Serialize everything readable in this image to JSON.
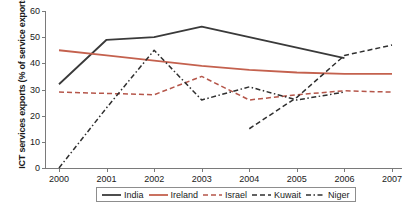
{
  "chart_data": {
    "type": "line",
    "title": "",
    "xlabel": "",
    "ylabel": "ICT services exports (% of service exports)",
    "x": [
      2000,
      2001,
      2002,
      2003,
      2004,
      2005,
      2006,
      2007
    ],
    "xtick_labels": [
      "2000",
      "2001",
      "2002",
      "2003",
      "2004",
      "2005",
      "2006",
      "2007"
    ],
    "ytick_labels": [
      "0",
      "10",
      "20",
      "30",
      "40",
      "50",
      "60"
    ],
    "ylim": [
      0,
      60
    ],
    "ytick_step": 10,
    "grid": false,
    "legend_position": "bottom-center",
    "series": [
      {
        "name": "India",
        "color": "#3a3a3a",
        "style": "solid",
        "x": [
          2000,
          2001,
          2002,
          2003,
          2004,
          2005,
          2006
        ],
        "values": [
          32,
          49,
          50,
          54,
          50,
          46,
          42
        ]
      },
      {
        "name": "Ireland",
        "color": "#c4614e",
        "style": "solid",
        "x": [
          2000,
          2001,
          2002,
          2003,
          2004,
          2005,
          2006,
          2007
        ],
        "values": [
          45,
          43,
          41,
          39,
          37.5,
          36.5,
          36,
          36
        ]
      },
      {
        "name": "Israel",
        "color": "#b5564a",
        "style": "dashed",
        "x": [
          2000,
          2001,
          2002,
          2003,
          2004,
          2005,
          2006,
          2007
        ],
        "values": [
          29,
          28.5,
          28,
          35,
          26,
          28,
          29.5,
          29
        ]
      },
      {
        "name": "Kuwait",
        "color": "#2f2f2f",
        "style": "dashed",
        "x": [
          2004,
          2005,
          2006,
          2007
        ],
        "values": [
          15,
          27,
          43,
          47
        ]
      },
      {
        "name": "Niger",
        "color": "#2f2f2f",
        "style": "dashdot",
        "x": [
          2000,
          2001,
          2002,
          2003,
          2004,
          2005,
          2006
        ],
        "values": [
          0,
          23,
          45,
          26,
          31,
          26,
          29
        ]
      }
    ]
  },
  "legend": {
    "items": [
      {
        "label": "India"
      },
      {
        "label": "Ireland"
      },
      {
        "label": "Israel"
      },
      {
        "label": "Kuwait"
      },
      {
        "label": "Niger"
      }
    ]
  }
}
